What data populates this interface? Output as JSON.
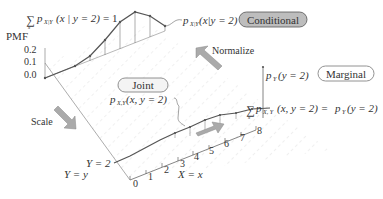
{
  "axes": {
    "pmf_label": "PMF",
    "pmf_ticks": [
      "0.2",
      "0.1",
      "0.0"
    ],
    "x_ticks": [
      "0",
      "1",
      "2",
      "3",
      "4",
      "5",
      "6",
      "7",
      "8"
    ],
    "x_label": "X = x",
    "y_fixed_label": "Y = 2",
    "y_label": "Y = y"
  },
  "labels": {
    "conditional_sum": "= 1",
    "conditional_sum_expr": "p",
    "conditional_sum_sub": "X|Y",
    "conditional_sum_arg": "(x | y = 2)",
    "conditional_pmf": "p",
    "conditional_pmf_sub": "X|Y",
    "conditional_pmf_arg": "(x|y = 2)",
    "joint_pmf": "p",
    "joint_pmf_sub": "X,Y",
    "joint_pmf_arg": "(x, y = 2)",
    "marginal_value": "p",
    "marginal_value_sub": "Y",
    "marginal_value_arg": "(y = 2)",
    "marginal_sum": "p",
    "marginal_sum_sub": "X, Y",
    "marginal_sum_arg": "(x, y = 2) = ",
    "marginal_sum_rhs": "p",
    "marginal_sum_rhs_sub": "Y",
    "marginal_sum_rhs_arg": "(y = 2)"
  },
  "badges": {
    "conditional": "Conditional",
    "joint": "Joint",
    "marginal": "Marginal"
  },
  "arrows": {
    "normalize": "Normalize",
    "scale": "Scale"
  },
  "colors": {
    "curve": "#555555",
    "grid": "#cccccc",
    "arrow": "#999999",
    "conditional_badge": "#bdbdbd",
    "badge_border": "#666666"
  }
}
